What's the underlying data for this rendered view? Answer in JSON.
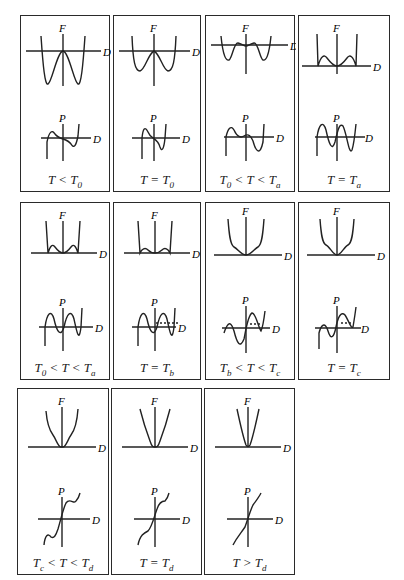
{
  "figure": {
    "axis_labels": {
      "free_energy": "F",
      "polarization": "P",
      "horizontal": "D"
    },
    "panels": [
      {
        "id": "p1",
        "condition": "T < T0",
        "caption": {
          "pre": "T < T",
          "sub": "0",
          "mid": "",
          "sub2": ""
        },
        "f_shape": "deep-double-well-max-at-origin",
        "p_shape": "cubic-S"
      },
      {
        "id": "p2",
        "condition": "T = T0",
        "caption": {
          "pre": "T = T",
          "sub": "0",
          "mid": "",
          "sub2": ""
        },
        "f_shape": "double-well-flat-origin",
        "p_shape": "cubic-S-steep"
      },
      {
        "id": "p3",
        "condition": "T0 < T < Ta",
        "caption": {
          "pre": "T",
          "sub": "0",
          "mid": " < T < T",
          "sub2": "a"
        },
        "f_shape": "triple-well-shallow",
        "p_shape": "quintic"
      },
      {
        "id": "p4",
        "condition": "T = Ta",
        "caption": {
          "pre": "T = T",
          "sub": "a",
          "mid": "",
          "sub2": ""
        },
        "f_shape": "triple-well-equal-minima",
        "p_shape": "quintic-symmetric"
      },
      {
        "id": "p5",
        "condition": "T0 < T < Ta",
        "caption": {
          "pre": "T",
          "sub": "0",
          "mid": " < T < T",
          "sub2": "a"
        },
        "f_shape": "triple-well-raised-sides",
        "p_shape": "quintic-wide"
      },
      {
        "id": "p6",
        "condition": "T = Tb",
        "caption": {
          "pre": "T = T",
          "sub": "b",
          "mid": "",
          "sub2": ""
        },
        "f_shape": "triple-well-flattening",
        "p_shape": "quintic-dashed-tangent"
      },
      {
        "id": "p7",
        "condition": "Tb < T < Tc",
        "caption": {
          "pre": "T",
          "sub": "b",
          "mid": " < T < T",
          "sub2": "c"
        },
        "f_shape": "central-min-shoulders",
        "p_shape": "quintic-shifted"
      },
      {
        "id": "p8",
        "condition": "T = Tc",
        "caption": {
          "pre": "T = T",
          "sub": "c",
          "mid": "",
          "sub2": ""
        },
        "f_shape": "central-min-inflection-shoulders",
        "p_shape": "quintic-touching"
      },
      {
        "id": "p9",
        "condition": "Tc < T < Td",
        "caption": {
          "pre": "T",
          "sub": "c",
          "mid": " < T < T",
          "sub2": "d"
        },
        "f_shape": "single-well-kinked",
        "p_shape": "s-wiggle"
      },
      {
        "id": "p10",
        "condition": "T = Td",
        "caption": {
          "pre": "T = T",
          "sub": "d",
          "mid": "",
          "sub2": ""
        },
        "f_shape": "single-well-v",
        "p_shape": "s-inflection"
      },
      {
        "id": "p11",
        "condition": "T > Td",
        "caption": {
          "pre": "T > T",
          "sub": "d",
          "mid": "",
          "sub2": ""
        },
        "f_shape": "single-well-narrow",
        "p_shape": "monotonic"
      }
    ]
  }
}
